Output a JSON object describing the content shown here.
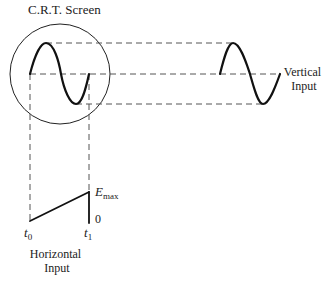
{
  "title": "C.R.T. Screen",
  "labels": {
    "crt_screen": "C.R.T. Screen",
    "vertical_line1": "Vertical",
    "vertical_line2": "Input",
    "horizontal_line1": "Horizontal",
    "horizontal_line2": "Input",
    "emax_main": "E",
    "emax_sub": "max",
    "zero": "0",
    "t0_main": "t",
    "t0_sub": "0",
    "t1_main": "t",
    "t1_sub": "1"
  },
  "colors": {
    "line": "#111111",
    "dash": "#555555",
    "background": "#ffffff"
  }
}
